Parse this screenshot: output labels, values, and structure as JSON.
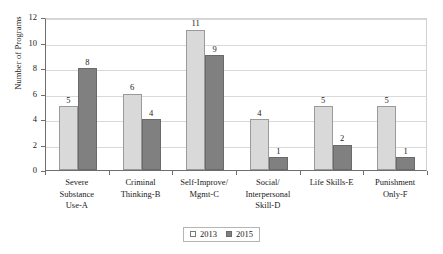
{
  "chart_data": {
    "type": "bar",
    "title": "",
    "xlabel": "",
    "ylabel": "Number of Programs",
    "ylim": [
      0,
      12
    ],
    "ytick_step": 2,
    "yticks": [
      0,
      2,
      4,
      6,
      8,
      10,
      12
    ],
    "grid": true,
    "legend_position": "bottom-center",
    "categories": [
      "Severe\nSubstance\nUse-A",
      "Criminal\nThinking-B",
      "Self-Improve/\nMgmt-C",
      "Social/\nInterpersonal\nSkill-D",
      "Life Skills-E",
      "Punishment\nOnly-F"
    ],
    "series": [
      {
        "name": "2013",
        "color": "#d9d9d9",
        "values": [
          5,
          6,
          11,
          4,
          5,
          5
        ]
      },
      {
        "name": "2015",
        "color": "#808080",
        "values": [
          8,
          4,
          9,
          1,
          2,
          1
        ]
      }
    ]
  }
}
